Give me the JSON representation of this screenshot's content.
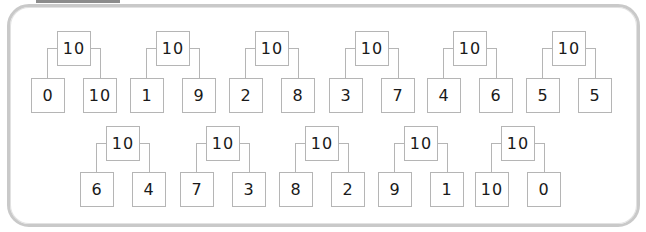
{
  "rows": [
    [
      {
        "whole": "10",
        "left": "0",
        "right": "10"
      },
      {
        "whole": "10",
        "left": "1",
        "right": "9"
      },
      {
        "whole": "10",
        "left": "2",
        "right": "8"
      },
      {
        "whole": "10",
        "left": "3",
        "right": "7"
      },
      {
        "whole": "10",
        "left": "4",
        "right": "6"
      },
      {
        "whole": "10",
        "left": "5",
        "right": "5"
      }
    ],
    [
      {
        "whole": "10",
        "left": "6",
        "right": "4"
      },
      {
        "whole": "10",
        "left": "7",
        "right": "3"
      },
      {
        "whole": "10",
        "left": "8",
        "right": "2"
      },
      {
        "whole": "10",
        "left": "9",
        "right": "1"
      },
      {
        "whole": "10",
        "left": "10",
        "right": "0"
      }
    ]
  ],
  "colors": {
    "border": "#c9c9c9",
    "box_border": "#b5b5b5",
    "text": "#1a1a1a"
  }
}
